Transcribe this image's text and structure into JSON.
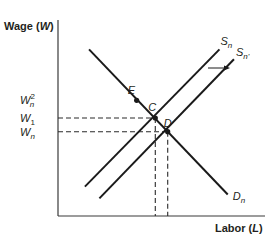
{
  "chart_data": {
    "type": "line",
    "title": "",
    "xlabel": "Labor",
    "xlabel_var": "L",
    "ylabel": "Wage",
    "ylabel_var": "W",
    "xlim": [
      0,
      10
    ],
    "ylim": [
      0,
      10
    ],
    "grid": false,
    "series": [
      {
        "name": "Dn",
        "label_base": "D",
        "label_sub": "n",
        "points": [
          [
            1.5,
            8.5
          ],
          [
            8.2,
            1.1
          ]
        ]
      },
      {
        "name": "Sn",
        "label_base": "S",
        "label_sub": "n",
        "points": [
          [
            1.3,
            1.5
          ],
          [
            7.8,
            8.5
          ]
        ]
      },
      {
        "name": "Sn'",
        "label_base": "S",
        "label_sub": "n'",
        "points": [
          [
            2.0,
            0.9
          ],
          [
            8.5,
            8.0
          ]
        ]
      }
    ],
    "points": [
      {
        "name": "E",
        "x": 3.8,
        "y": 5.9
      },
      {
        "name": "C",
        "x": 4.7,
        "y": 5.0
      },
      {
        "name": "D",
        "x": 5.3,
        "y": 4.3
      }
    ],
    "y_tick_labels": [
      {
        "base": "W",
        "sub": "n",
        "sup": "2",
        "value": 5.9
      },
      {
        "base": "W",
        "sub": "1",
        "sup": "",
        "value": 5.0
      },
      {
        "base": "W",
        "sub": "n",
        "sup": "",
        "value": 4.3
      }
    ],
    "reference_lines": [
      {
        "type": "horizontal",
        "from_point": "C",
        "value": 5.0,
        "style": "dashed"
      },
      {
        "type": "horizontal",
        "from_point": "D",
        "value": 4.3,
        "style": "dashed"
      },
      {
        "type": "vertical",
        "from_point": "C",
        "value": 4.7,
        "style": "dashed"
      },
      {
        "type": "vertical",
        "from_point": "D",
        "value": 5.3,
        "style": "dashed"
      }
    ],
    "annotations": [
      {
        "type": "arrow",
        "direction": "right",
        "meaning": "supply shift from Sn to Sn'"
      }
    ]
  },
  "labels": {
    "ylabel_text": "Wage (",
    "ylabel_var": "W",
    "ylabel_close": ")",
    "xlabel_text": "Labor (",
    "xlabel_var": "L",
    "xlabel_close": ")"
  }
}
